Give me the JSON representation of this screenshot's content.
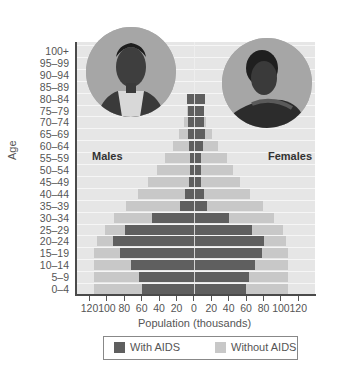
{
  "chart_data": {
    "type": "bar",
    "subtype": "population-pyramid",
    "title": "",
    "xlabel": "Population (thousands)",
    "ylabel": "Age",
    "xlim": [
      -120,
      120
    ],
    "x_ticks": [
      "120",
      "100",
      "80",
      "60",
      "40",
      "20",
      "0",
      "20",
      "40",
      "60",
      "80",
      "100",
      "120"
    ],
    "categories": [
      "100+",
      "95–99",
      "90–94",
      "85–89",
      "80–84",
      "75–79",
      "70–74",
      "65–69",
      "60–64",
      "55–59",
      "50–54",
      "45–49",
      "40–44",
      "35–39",
      "30–34",
      "25–29",
      "20–24",
      "15–19",
      "10–14",
      "5–9",
      "0–4"
    ],
    "group_labels": {
      "left": "Males",
      "right": "Females"
    },
    "legend": [
      {
        "label": "With AIDS",
        "color": "#5f5f5f"
      },
      {
        "label": "Without AIDS",
        "color": "#c8c8c8"
      }
    ],
    "series": [
      {
        "name": "Males - With AIDS",
        "values": [
          0,
          0,
          0,
          0,
          8,
          7,
          7,
          7,
          6,
          5,
          5,
          6,
          10,
          16,
          48,
          80,
          93,
          86,
          73,
          64,
          60
        ]
      },
      {
        "name": "Males - Without AIDS (total projection)",
        "values": [
          0,
          0,
          0,
          0,
          8,
          8,
          12,
          17,
          24,
          33,
          43,
          53,
          65,
          79,
          92,
          103,
          112,
          116,
          116,
          116,
          116
        ]
      },
      {
        "name": "Females - With AIDS",
        "values": [
          0,
          0,
          0,
          0,
          13,
          11,
          11,
          13,
          10,
          8,
          8,
          8,
          11,
          15,
          40,
          67,
          81,
          79,
          70,
          63,
          60
        ]
      },
      {
        "name": "Females - Without AIDS (total projection)",
        "values": [
          0,
          0,
          0,
          0,
          13,
          11,
          14,
          21,
          28,
          38,
          45,
          53,
          65,
          80,
          92,
          103,
          106,
          108,
          108,
          108,
          108
        ]
      }
    ],
    "grid": true,
    "legend_position": "bottom"
  },
  "labels": {
    "males": "Males",
    "females": "Females",
    "xlabel": "Population (thousands)",
    "ylabel": "Age",
    "legend_with": "With AIDS",
    "legend_without": "Without AIDS"
  },
  "images": {
    "left_photo": "portrait-elderly-man",
    "right_photo": "portrait-woman-head-on-hands"
  }
}
